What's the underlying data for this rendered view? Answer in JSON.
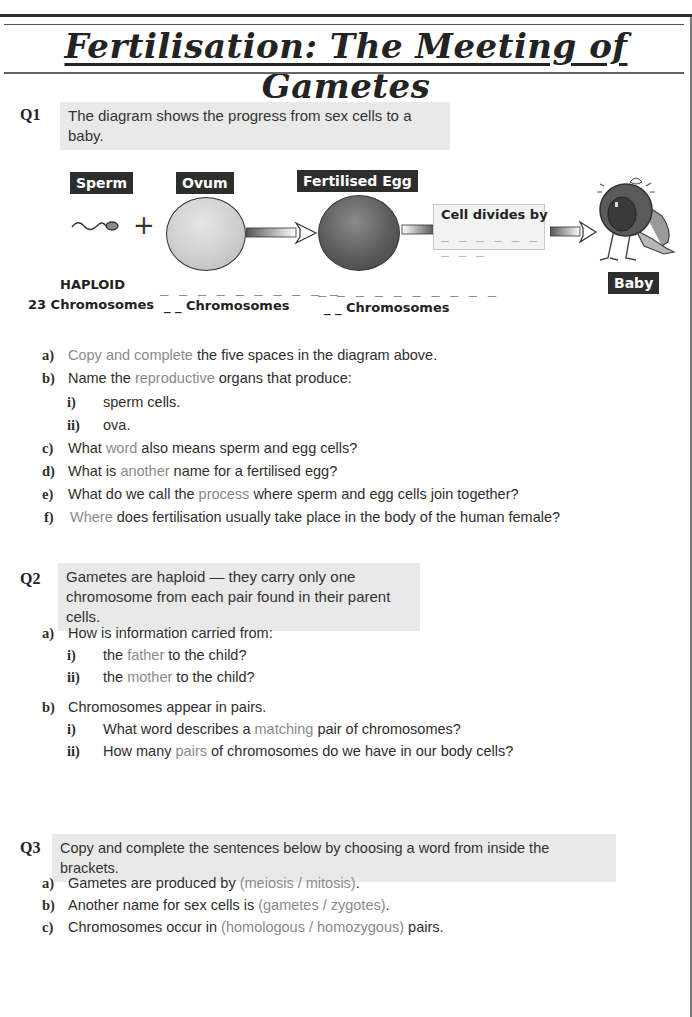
{
  "page": {
    "title": "Fertilisation: The Meeting of Gametes"
  },
  "q1": {
    "label": "Q1",
    "prompt": "The diagram shows the progress from sex cells to a baby.",
    "diagram": {
      "sperm_tag": "Sperm",
      "ovum_tag": "Ovum",
      "egg_tag": "Fertilised Egg",
      "baby_tag": "Baby",
      "plus_symbol": "+",
      "cell_divides_label": "Cell divides by",
      "cell_divides_blank": "_ _ _ _ _ _ _ _ _",
      "haploid_label": "HAPLOID",
      "sperm_count": "23 Chromosomes",
      "ovum_blank_line": "_ _ _ _ _ _ _ _ _ _",
      "ovum_count": "_ _ Chromosomes",
      "egg_blank_line": "_ _ _ _ _ _ _ _ _ _",
      "egg_count": "_ _ Chromosomes",
      "icons": {
        "sperm": "sperm-icon",
        "ovum": "ovum-cell-icon",
        "egg": "fertilised-egg-icon",
        "baby": "crying-baby-icon",
        "arrow": "right-arrow-icon"
      }
    },
    "items": [
      {
        "label": "a)",
        "pre": "",
        "hl": "Copy and complete",
        "post": " the five spaces in the diagram above."
      },
      {
        "label": "b)",
        "pre": "Name the ",
        "hl": "reproductive",
        "post": " organs that produce:"
      },
      {
        "label": "i)",
        "text": "sperm cells."
      },
      {
        "label": "ii)",
        "text": "ova."
      },
      {
        "label": "c)",
        "pre": "What ",
        "hl": "word",
        "post": " also means sperm and egg cells?"
      },
      {
        "label": "d)",
        "pre": "What is ",
        "hl": "another",
        "post": " name for a fertilised egg?"
      },
      {
        "label": "e)",
        "pre": "What do we call the ",
        "hl": "process",
        "post": " where sperm and egg cells join together?"
      },
      {
        "label": "f)",
        "pre": "",
        "hl": "Where",
        "post": " does fertilisation usually take place in the body of the human female?"
      }
    ]
  },
  "q2": {
    "label": "Q2",
    "prompt_line1": "Gametes are haploid — they carry only one",
    "prompt_line2": "chromosome from each pair found in their parent cells.",
    "items": [
      {
        "label": "a)",
        "text": "How is information carried from:"
      },
      {
        "label": "i)",
        "pre": "the ",
        "hl": "father",
        "post": " to the child?"
      },
      {
        "label": "ii)",
        "pre": "the ",
        "hl": "mother",
        "post": " to the child?"
      },
      {
        "label": "b)",
        "text": "Chromosomes appear in pairs."
      },
      {
        "label": "i)",
        "pre": "What word describes a ",
        "hl": "matching",
        "post": " pair of chromosomes?"
      },
      {
        "label": "ii)",
        "pre": "How many ",
        "hl": "pairs",
        "post": " of chromosomes do we have in our body cells?"
      }
    ]
  },
  "q3": {
    "label": "Q3",
    "prompt": "Copy and complete the sentences below by choosing a word from inside the brackets.",
    "items": [
      {
        "label": "a)",
        "pre": "Gametes are produced by ",
        "hl": "(meiosis / mitosis)",
        "post": "."
      },
      {
        "label": "b)",
        "pre": "Another name for sex cells is ",
        "hl": "(gametes / zygotes)",
        "post": "."
      },
      {
        "label": "c)",
        "pre": "Chromosomes occur in ",
        "hl": "(homologous / homozygous)",
        "post": " pairs."
      }
    ]
  },
  "colors": {
    "text": "#2e2e2e",
    "highlight_text": "#8a8a8a",
    "prompt_bg": "#e9e9e9",
    "tag_bg": "#2d2d2d"
  }
}
